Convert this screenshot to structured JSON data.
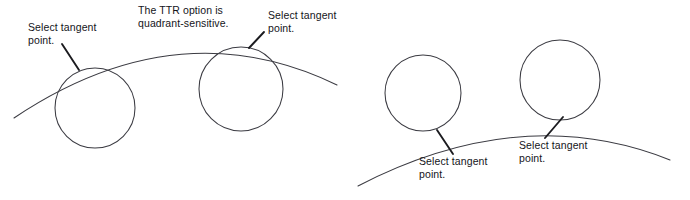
{
  "figure": {
    "width": 690,
    "height": 200,
    "background_color": "#ffffff",
    "stroke_color": "#3b3b42",
    "leader_color": "#1b1b1f",
    "text_color": "#14141a"
  },
  "notes": {
    "ttr": {
      "line1": "The TTR option is",
      "line2": "quadrant-sensitive."
    }
  },
  "labels": {
    "tangent_1": {
      "line1": "Select tangent",
      "line2": "point."
    },
    "tangent_2": {
      "line1": "Select tangent",
      "line2": "point."
    },
    "tangent_3": {
      "line1": "Select tangent",
      "line2": "point."
    },
    "tangent_4": {
      "line1": "Select tangent",
      "line2": "point."
    }
  },
  "chart_data": {
    "type": "diagram",
    "panels": [
      {
        "name": "left-panel",
        "description": "Circles tangent below a convex arc; labels above.",
        "arc": {
          "name": "arc-left",
          "start": [
            14,
            118
          ],
          "control": [
            178,
            8
          ],
          "end": [
            337,
            85
          ]
        },
        "circles": [
          {
            "name": "circle-left-1",
            "cx": 95,
            "cy": 108,
            "r": 40
          },
          {
            "name": "circle-left-2",
            "cx": 241,
            "cy": 89,
            "r": 42
          }
        ],
        "tangent_points": [
          {
            "name": "tangent-point-1",
            "x": 76,
            "y": 72
          },
          {
            "name": "tangent-point-2",
            "x": 249,
            "y": 47
          }
        ],
        "leaders": [
          {
            "name": "leader-1",
            "from": [
              62,
              44
            ],
            "to": [
              79,
              70
            ]
          },
          {
            "name": "leader-2",
            "from": [
              264,
              32
            ],
            "to": [
              249,
              48
            ]
          }
        ]
      },
      {
        "name": "right-panel",
        "description": "Circles tangent above a convex arc; labels below.",
        "arc": {
          "name": "arc-right",
          "start": [
            358,
            186
          ],
          "control": [
            522,
            101
          ],
          "end": [
            670,
            160
          ]
        },
        "circles": [
          {
            "name": "circle-right-1",
            "cx": 423,
            "cy": 93,
            "r": 38
          },
          {
            "name": "circle-right-2",
            "cx": 560,
            "cy": 80,
            "r": 40
          }
        ],
        "tangent_points": [
          {
            "name": "tangent-point-3",
            "x": 437,
            "y": 130
          },
          {
            "name": "tangent-point-4",
            "x": 562,
            "y": 119
          }
        ],
        "leaders": [
          {
            "name": "leader-3",
            "from": [
              437,
              130
            ],
            "to": [
              453,
              154
            ]
          },
          {
            "name": "leader-4",
            "from": [
              563,
              117
            ],
            "to": [
              545,
              138
            ]
          }
        ]
      }
    ]
  }
}
